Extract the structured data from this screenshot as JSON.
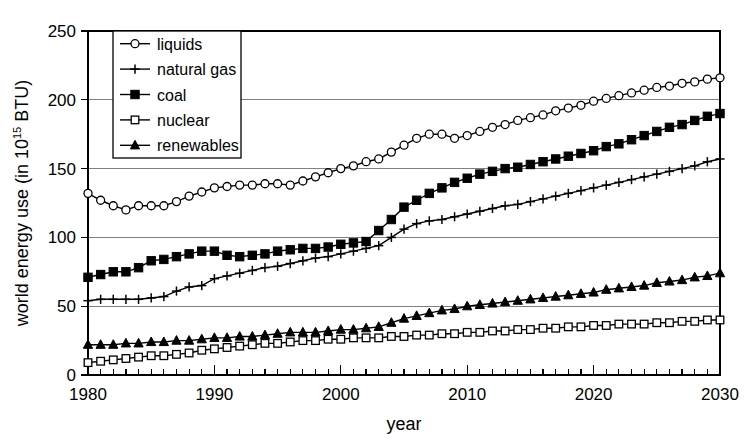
{
  "chart_data": {
    "type": "line",
    "title": "",
    "xlabel": "year",
    "ylabel": "world energy use (in 10",
    "ylabel_sup": "15",
    "ylabel_tail": " BTU)",
    "xlim": [
      1980,
      2030
    ],
    "ylim": [
      0,
      250
    ],
    "ytick_values": [
      0,
      50,
      100,
      150,
      200,
      250
    ],
    "ytick_labels": [
      "0",
      "50",
      "100",
      "150",
      "200",
      "250"
    ],
    "xtick_values": [
      1980,
      1990,
      2000,
      2010,
      2020,
      2030
    ],
    "xtick_labels": [
      "1980",
      "1990",
      "2000",
      "2010",
      "2020",
      "2030"
    ],
    "x_minor_tick_step": 1,
    "grid": "horizontal",
    "legend_position": "top-left-inside",
    "x": [
      1980,
      1981,
      1982,
      1983,
      1984,
      1985,
      1986,
      1987,
      1988,
      1989,
      1990,
      1991,
      1992,
      1993,
      1994,
      1995,
      1996,
      1997,
      1998,
      1999,
      2000,
      2001,
      2002,
      2003,
      2004,
      2005,
      2006,
      2007,
      2008,
      2009,
      2010,
      2011,
      2012,
      2013,
      2014,
      2015,
      2016,
      2017,
      2018,
      2019,
      2020,
      2021,
      2022,
      2023,
      2024,
      2025,
      2026,
      2027,
      2028,
      2029,
      2030
    ],
    "series": [
      {
        "name": "liquids",
        "marker": "open-circle",
        "values": [
          132,
          127,
          123,
          120,
          123,
          123,
          123,
          126,
          130,
          133,
          136,
          137,
          138,
          138,
          139,
          139,
          138,
          141,
          144,
          147,
          150,
          152,
          155,
          157,
          162,
          167,
          172,
          175,
          175,
          172,
          174,
          177,
          180,
          182,
          185,
          187,
          189,
          192,
          194,
          196,
          199,
          201,
          203,
          205,
          207,
          209,
          210,
          212,
          213,
          215,
          216
        ]
      },
      {
        "name": "natural gas",
        "marker": "plus",
        "values": [
          54,
          55,
          55,
          55,
          55,
          56,
          57,
          61,
          64,
          65,
          70,
          72,
          74,
          76,
          78,
          79,
          81,
          83,
          85,
          86,
          88,
          90,
          92,
          94,
          100,
          106,
          110,
          112,
          113,
          115,
          117,
          119,
          121,
          123,
          124,
          126,
          128,
          130,
          132,
          134,
          136,
          138,
          140,
          142,
          144,
          146,
          148,
          150,
          152,
          155,
          157
        ]
      },
      {
        "name": "coal",
        "marker": "solid-square",
        "values": [
          71,
          73,
          75,
          75,
          78,
          83,
          84,
          86,
          88,
          90,
          90,
          87,
          86,
          87,
          88,
          90,
          91,
          92,
          92,
          93,
          95,
          96,
          97,
          105,
          113,
          122,
          127,
          132,
          136,
          140,
          143,
          146,
          148,
          150,
          151,
          153,
          155,
          157,
          159,
          161,
          163,
          166,
          168,
          171,
          174,
          177,
          180,
          182,
          185,
          188,
          190
        ]
      },
      {
        "name": "nuclear",
        "marker": "open-square",
        "values": [
          9,
          10,
          11,
          12,
          13,
          14,
          14,
          15,
          16,
          18,
          19,
          20,
          21,
          22,
          23,
          23,
          24,
          25,
          25,
          26,
          26,
          27,
          27,
          27,
          28,
          28,
          29,
          29,
          30,
          30,
          31,
          31,
          32,
          32,
          33,
          33,
          34,
          34,
          35,
          35,
          36,
          36,
          37,
          37,
          37,
          38,
          38,
          39,
          39,
          40,
          40
        ]
      },
      {
        "name": "renewables",
        "marker": "solid-triangle",
        "values": [
          22,
          22,
          22,
          23,
          23,
          24,
          24,
          25,
          25,
          26,
          27,
          27,
          28,
          28,
          29,
          30,
          31,
          31,
          31,
          32,
          33,
          33,
          34,
          35,
          38,
          41,
          43,
          45,
          47,
          48,
          50,
          51,
          52,
          53,
          54,
          55,
          56,
          57,
          58,
          59,
          60,
          62,
          63,
          64,
          65,
          67,
          68,
          69,
          71,
          72,
          74
        ]
      }
    ]
  },
  "legend": {
    "entries": [
      {
        "label": "liquids"
      },
      {
        "label": "natural gas"
      },
      {
        "label": "coal"
      },
      {
        "label": "nuclear"
      },
      {
        "label": "renewables"
      }
    ]
  }
}
